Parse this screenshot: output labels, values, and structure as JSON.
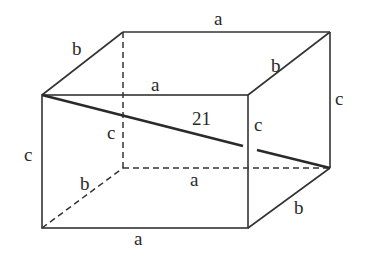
{
  "diagram": {
    "type": "rectangular-prism",
    "labels": {
      "top_back_a": "a",
      "top_left_b": "b",
      "top_front_a": "a",
      "top_right_b": "b",
      "back_right_c": "c",
      "diagonal": "21",
      "hidden_c": "c",
      "front_right_c": "c",
      "front_left_c": "c",
      "hidden_bottom_b": "b",
      "hidden_bottom_a": "a",
      "bottom_right_b": "b",
      "bottom_front_a": "a"
    },
    "colors": {
      "line": "#333333",
      "background": "#ffffff"
    }
  }
}
